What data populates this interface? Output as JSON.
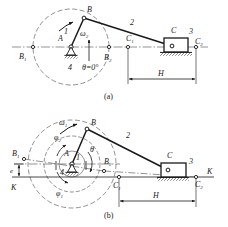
{
  "figure": {
    "type": "mechanism-kinematic-diagram",
    "stroke_color": "#1a1a1a",
    "background_color": "#ffffff",
    "captions": [
      {
        "id": "a",
        "text": "(a)"
      },
      {
        "id": "b",
        "text": "(b)"
      }
    ]
  },
  "panel_a": {
    "caption": "(a)",
    "points": {
      "A": "A",
      "B": "B",
      "B1": "B",
      "B1_sub": "1",
      "B2": "B",
      "B2_sub": "2",
      "C": "C",
      "C1": "C",
      "C1_sub": "1",
      "C2": "C",
      "C2_sub": "2"
    },
    "links": {
      "crank": "1",
      "coupler": "2",
      "slider": "3",
      "frame": "4"
    },
    "angles": {
      "omega2": "ω",
      "omega2_sub": "2",
      "theta": "θ=0°"
    },
    "dimensions": {
      "stroke": "H"
    }
  },
  "panel_b": {
    "caption": "(b)",
    "points": {
      "A": "A",
      "B": "B",
      "B1": "B",
      "B1_sub": "1",
      "B2": "B",
      "B2_sub": "2",
      "C": "C",
      "C1": "C",
      "C1_sub": "1",
      "C2": "C",
      "C2_sub": "2"
    },
    "links": {
      "crank": "1",
      "coupler": "2",
      "slider": "3",
      "frame": "4"
    },
    "angles": {
      "omega1": "ω",
      "omega1_sub": "1",
      "phi1": "φ",
      "phi1_sub": "1",
      "phi2": "φ",
      "phi2_sub": "2",
      "theta": "θ"
    },
    "dimensions": {
      "stroke": "H",
      "eccentricity": "e"
    },
    "axis": {
      "left_label": "K",
      "right_label": "K"
    }
  }
}
